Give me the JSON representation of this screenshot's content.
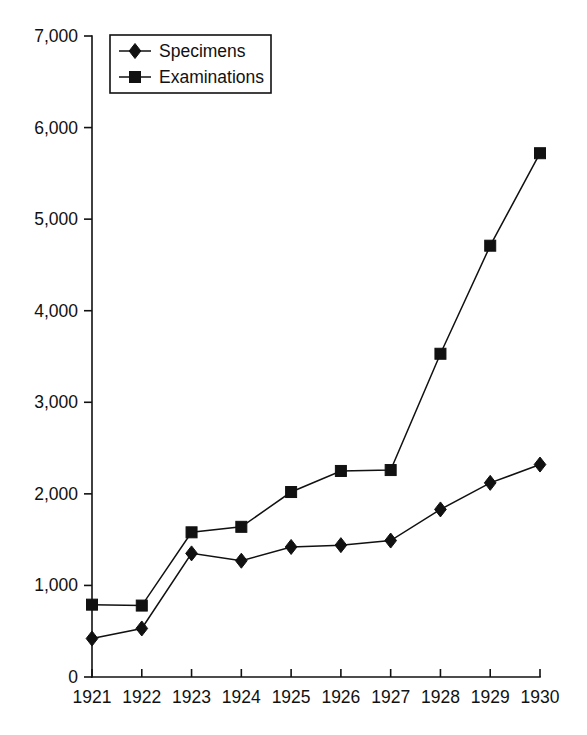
{
  "chart_data": {
    "type": "line",
    "title": "",
    "subtitle": "",
    "xlabel": "",
    "ylabel": "",
    "categories": [
      "1921",
      "1922",
      "1923",
      "1924",
      "1925",
      "1926",
      "1927",
      "1928",
      "1929",
      "1930"
    ],
    "x": [
      1921,
      1922,
      1923,
      1924,
      1925,
      1926,
      1927,
      1928,
      1929,
      1930
    ],
    "series": [
      {
        "name": "Specimens",
        "marker": "diamond",
        "color": "#111111",
        "values": [
          420,
          530,
          1350,
          1270,
          1420,
          1440,
          1490,
          1830,
          2120,
          2320
        ]
      },
      {
        "name": "Examinations",
        "marker": "square",
        "color": "#111111",
        "values": [
          790,
          780,
          1580,
          1640,
          2020,
          2250,
          2260,
          3530,
          4710,
          5720
        ]
      }
    ],
    "ylim": [
      0,
      7000
    ],
    "xlim": [
      1921,
      1930
    ],
    "y_ticks": [
      0,
      1000,
      2000,
      3000,
      4000,
      5000,
      6000,
      7000
    ],
    "y_tick_labels": [
      "0",
      "1,000",
      "2,000",
      "3,000",
      "4,000",
      "5,000",
      "6,000",
      "7,000"
    ],
    "x_tick_labels": [
      "1921",
      "1922",
      "1923",
      "1924",
      "1925",
      "1926",
      "1927",
      "1928",
      "1929",
      "1930"
    ],
    "grid": false,
    "legend_position": "top-left",
    "legend_entries": [
      "Specimens",
      "Examinations"
    ],
    "background_color": "#ffffff",
    "axis_color": "#111111"
  }
}
